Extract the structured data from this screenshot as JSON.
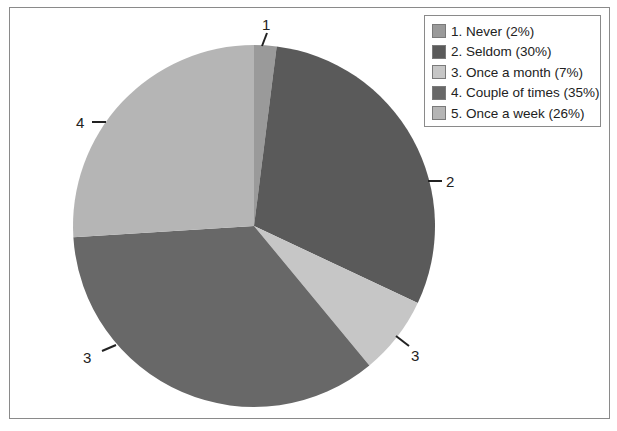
{
  "chart_data": {
    "type": "pie",
    "title": "",
    "categories": [
      "1. Never",
      "2. Seldom",
      "3. Once a month",
      "4. Couple of times",
      "5. Once a week"
    ],
    "values": [
      2,
      30,
      7,
      35,
      26
    ],
    "unit": "%",
    "slice_labels": [
      "1",
      "2",
      "3",
      "3",
      "4"
    ],
    "legend_position": "top-right",
    "start_angle_deg": 0,
    "direction": "clockwise",
    "colors": [
      "#9a9a9a",
      "#5a5a5a",
      "#c6c6c6",
      "#686868",
      "#b5b5b5"
    ]
  },
  "legend": {
    "items": [
      {
        "label": "1. Never (2%)",
        "color": "#9a9a9a"
      },
      {
        "label": "2. Seldom (30%)",
        "color": "#5a5a5a"
      },
      {
        "label": "3. Once a month (7%)",
        "color": "#c6c6c6"
      },
      {
        "label": "4. Couple of times (35%)",
        "color": "#686868"
      },
      {
        "label": "5. Once a week (26%)",
        "color": "#b5b5b5"
      }
    ]
  },
  "data_labels": {
    "never": "1",
    "seldom": "2",
    "once_a_month": "3",
    "couple_of_times": "3",
    "once_a_week": "4"
  }
}
